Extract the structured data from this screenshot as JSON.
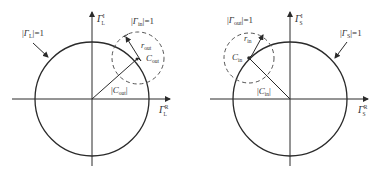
{
  "colors": {
    "stroke": "#2a2a2a",
    "dashed": "#555555",
    "text": "#333333",
    "background": "#ffffff"
  },
  "left_diagram": {
    "unit_circle_label": {
      "prefix": "|",
      "gamma": "Γ",
      "sub": "L",
      "sup": "*",
      "suffix": "|=1"
    },
    "dashed_circle_label": {
      "prefix": "|",
      "gamma": "Γ",
      "sub": "in",
      "suffix": "|=1"
    },
    "imag_axis_label": {
      "gamma": "Γ",
      "sup": "I",
      "sub": "L"
    },
    "real_axis_label": {
      "gamma": "Γ",
      "sup": "R",
      "sub": "L"
    },
    "radius_label": {
      "r": "r",
      "sub": "out"
    },
    "center_label": {
      "c": "C",
      "sub": "out"
    },
    "magnitude_label": {
      "prefix": "|",
      "c": "C",
      "sub": "out",
      "suffix": "|"
    }
  },
  "right_diagram": {
    "unit_circle_label": {
      "prefix": "|",
      "gamma": "Γ",
      "sub": "S",
      "sup": "*",
      "suffix": "|=1"
    },
    "dashed_circle_label": {
      "prefix": "|",
      "gamma": "Γ",
      "sub": "out",
      "suffix": "|=1"
    },
    "imag_axis_label": {
      "gamma": "Γ",
      "sup": "I",
      "sub": "S"
    },
    "real_axis_label": {
      "gamma": "Γ",
      "sup": "R",
      "sub": "S"
    },
    "radius_label": {
      "r": "r",
      "sub": "in"
    },
    "center_label": {
      "c": "C",
      "sub": "in"
    },
    "magnitude_label": {
      "prefix": "|",
      "c": "C",
      "sub": "in",
      "suffix": "|"
    }
  }
}
